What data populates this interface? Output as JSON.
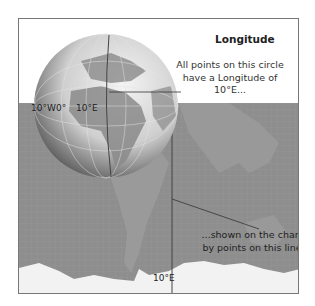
{
  "diagram": {
    "title": "Longitude",
    "globe_caption": "All points on this circle have a Longitude of 10°E...",
    "chart_caption": "...shown on the chart by points on this line",
    "globe_labels": {
      "w10": "10°W",
      "zero": "0°",
      "e10": "10°E"
    },
    "chart_label": "10°E",
    "colors": {
      "map_sea": "#8e8e8e",
      "map_land": "#a3a3a3",
      "ice": "#f2f2f2",
      "frame": "#777777"
    }
  }
}
